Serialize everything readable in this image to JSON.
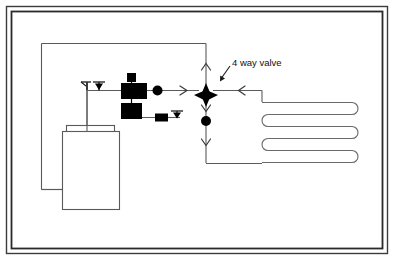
{
  "diagram": {
    "background_color": "#ffffff",
    "line_color": "#4a4a4a",
    "solid_color": "#000000",
    "frame": {
      "name": "outer-border-frame",
      "outer": {
        "x": 6,
        "y": 6,
        "width": 382,
        "height": 248
      },
      "inner": {
        "x": 11,
        "y": 11,
        "width": 372,
        "height": 238
      },
      "outer_stroke": "#3c3c3c",
      "inner_stroke": "#2a2a2a"
    },
    "labels": [
      {
        "id": "four-way-valve-label",
        "text": "4 way valve",
        "x": 232,
        "y": 64,
        "font_size": 9.5,
        "color": "#111111",
        "leader": {
          "from_x": 231,
          "to_x": 221,
          "from_y": 67,
          "to_y": 79
        }
      }
    ],
    "components": [
      {
        "id": "four-way-valve",
        "type": "four-way-reversing-valve",
        "x": 205,
        "y": 95,
        "size": 13,
        "fill": "#000000"
      },
      {
        "id": "compressor",
        "type": "compressor-block",
        "x": 122,
        "y": 84,
        "width": 24,
        "height": 16,
        "fill": "#000000"
      },
      {
        "id": "compressor-cap",
        "type": "small-square-fitting",
        "x": 127,
        "y": 74,
        "width": 8,
        "height": 8,
        "fill": "#000000"
      },
      {
        "id": "accumulator",
        "type": "accumulator-block",
        "x": 122,
        "y": 103,
        "width": 20,
        "height": 16,
        "fill": "#000000"
      },
      {
        "id": "sight-glass",
        "type": "round-valve",
        "x": 157,
        "y": 89,
        "radius": 5,
        "fill": "#000000"
      },
      {
        "id": "filter-drier",
        "type": "filter-drier-block",
        "x": 155,
        "y": 113,
        "width": 12,
        "height": 8,
        "fill": "#000000"
      },
      {
        "id": "lower-check-valve",
        "type": "round-valve",
        "x": 206,
        "y": 119,
        "radius": 5,
        "fill": "#000000"
      },
      {
        "id": "service-valve-upper",
        "type": "down-arrow-valve",
        "x": 99,
        "y": 82,
        "fill": "#000000"
      },
      {
        "id": "service-valve-lower",
        "type": "down-arrow-valve",
        "x": 176,
        "y": 110,
        "fill": "#000000"
      },
      {
        "id": "tank-rear",
        "type": "tank-outline",
        "x": 66,
        "y": 125,
        "width": 48,
        "height": 70,
        "stroke": "#4a4a4a"
      },
      {
        "id": "tank-front",
        "type": "tank-outline",
        "x": 62,
        "y": 131,
        "width": 57,
        "height": 78,
        "stroke": "#4a4a4a"
      },
      {
        "id": "radiant-floor-loop",
        "type": "serpentine-coil",
        "passes": 5,
        "x": 255,
        "y": 96,
        "width": 105,
        "height": 68,
        "stroke": "#6a6a6a"
      }
    ],
    "flow_markers": [
      {
        "id": "flow-right-main",
        "direction": "right",
        "x": 184,
        "y": 90
      },
      {
        "id": "flow-left-return",
        "direction": "left",
        "x": 242,
        "y": 90
      },
      {
        "id": "flow-up-top",
        "direction": "up",
        "x": 206,
        "y": 64
      },
      {
        "id": "flow-down-to-valve",
        "direction": "down",
        "x": 206,
        "y": 108
      },
      {
        "id": "flow-down-lower",
        "direction": "down",
        "x": 206,
        "y": 143
      }
    ],
    "piping": {
      "circuit_rect": {
        "x": 41,
        "y": 43,
        "width": 165,
        "height": 146
      },
      "suction_line_y": 90,
      "liquid_line_y": 117,
      "valve_column_x": 206
    }
  }
}
